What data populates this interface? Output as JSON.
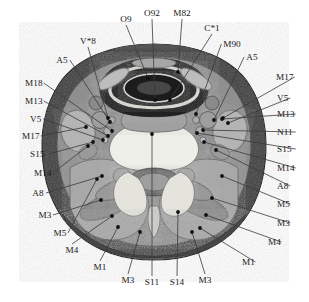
{
  "figure": {
    "type": "labeled-anatomical-cross-section",
    "background_color": "#ffffff",
    "outline_color": "#2b2b2b",
    "palette": {
      "skin_subcutaneous": "#3b3b3b",
      "muscle_mid_gray": "#8e8e8e",
      "muscle_light_gray": "#b9b9b9",
      "bone_marrow_bright": "#eeeeea",
      "air_lumen_dark": "#262626",
      "vessel_gray": "#9c9c9c",
      "cartilage_light": "#d6d6d2",
      "label_text": "#1a1a1a",
      "leader_line": "#3a3a3a"
    },
    "labels": [
      {
        "id": "L01",
        "code": "O9",
        "tx": 126,
        "ty": 22,
        "anchor": "middle",
        "px": 148,
        "py": 78,
        "side": "top"
      },
      {
        "id": "L02",
        "code": "O92",
        "tx": 152,
        "ty": 16,
        "anchor": "middle",
        "px": 155,
        "py": 100,
        "side": "top"
      },
      {
        "id": "L03",
        "code": "M82",
        "tx": 182,
        "ty": 16,
        "anchor": "middle",
        "px": 178,
        "py": 72,
        "side": "top"
      },
      {
        "id": "L04",
        "code": "C*1",
        "tx": 212,
        "ty": 31,
        "anchor": "middle",
        "px": 170,
        "py": 100,
        "side": "top"
      },
      {
        "id": "L05",
        "code": "M90",
        "tx": 232,
        "ty": 47,
        "anchor": "middle",
        "px": 196,
        "py": 114,
        "side": "right"
      },
      {
        "id": "L06",
        "code": "A5",
        "tx": 252,
        "ty": 60,
        "anchor": "middle",
        "px": 214,
        "py": 120,
        "side": "right"
      },
      {
        "id": "L07",
        "code": "M17",
        "tx": 276,
        "ty": 80,
        "anchor": "start",
        "px": 223,
        "py": 118,
        "side": "right"
      },
      {
        "id": "L08",
        "code": "V5",
        "tx": 277,
        "ty": 101,
        "anchor": "start",
        "px": 228,
        "py": 123,
        "side": "right"
      },
      {
        "id": "L09",
        "code": "M13",
        "tx": 277,
        "ty": 117,
        "anchor": "start",
        "px": 222,
        "py": 119,
        "side": "right"
      },
      {
        "id": "L10",
        "code": "N11",
        "tx": 277,
        "ty": 135,
        "anchor": "start",
        "px": 203,
        "py": 130,
        "side": "right"
      },
      {
        "id": "L11",
        "code": "S15",
        "tx": 277,
        "ty": 152,
        "anchor": "start",
        "px": 197,
        "py": 133,
        "side": "right"
      },
      {
        "id": "L12",
        "code": "M14",
        "tx": 277,
        "ty": 171,
        "anchor": "start",
        "px": 204,
        "py": 142,
        "side": "right"
      },
      {
        "id": "L13",
        "code": "A8",
        "tx": 277,
        "ty": 189,
        "anchor": "start",
        "px": 216,
        "py": 150,
        "side": "right"
      },
      {
        "id": "L14",
        "code": "M5",
        "tx": 277,
        "ty": 207,
        "anchor": "start",
        "px": 222,
        "py": 176,
        "side": "right"
      },
      {
        "id": "L15",
        "code": "M3",
        "tx": 277,
        "ty": 226,
        "anchor": "start",
        "px": 212,
        "py": 198,
        "side": "right"
      },
      {
        "id": "L16",
        "code": "M4",
        "tx": 268,
        "ty": 245,
        "anchor": "start",
        "px": 206,
        "py": 215,
        "side": "right"
      },
      {
        "id": "L17",
        "code": "M1",
        "tx": 242,
        "ty": 265,
        "anchor": "start",
        "px": 200,
        "py": 228,
        "side": "bottom"
      },
      {
        "id": "L18",
        "code": "M3",
        "tx": 205,
        "ty": 283,
        "anchor": "middle",
        "px": 192,
        "py": 232,
        "side": "bottom"
      },
      {
        "id": "L19",
        "code": "S14",
        "tx": 177,
        "ty": 285,
        "anchor": "middle",
        "px": 178,
        "py": 212,
        "side": "bottom"
      },
      {
        "id": "L20",
        "code": "S11",
        "tx": 152,
        "ty": 285,
        "anchor": "middle",
        "px": 152,
        "py": 134,
        "side": "bottom"
      },
      {
        "id": "L21",
        "code": "M3",
        "tx": 128,
        "ty": 283,
        "anchor": "middle",
        "px": 140,
        "py": 232,
        "side": "bottom"
      },
      {
        "id": "L22",
        "code": "M1",
        "tx": 100,
        "ty": 270,
        "anchor": "middle",
        "px": 118,
        "py": 227,
        "side": "bottom"
      },
      {
        "id": "L23",
        "code": "M4",
        "tx": 72,
        "ty": 253,
        "anchor": "middle",
        "px": 112,
        "py": 216,
        "side": "bottom"
      },
      {
        "id": "L24",
        "code": "M5",
        "tx": 60,
        "ty": 236,
        "anchor": "middle",
        "px": 97,
        "py": 179,
        "side": "left"
      },
      {
        "id": "L25",
        "code": "M3",
        "tx": 45,
        "ty": 218,
        "anchor": "middle",
        "px": 101,
        "py": 200,
        "side": "left"
      },
      {
        "id": "L26",
        "code": "A8",
        "tx": 38,
        "ty": 196,
        "anchor": "middle",
        "px": 102,
        "py": 176,
        "side": "left"
      },
      {
        "id": "L27",
        "code": "M14",
        "tx": 34,
        "ty": 176,
        "anchor": "start",
        "px": 88,
        "py": 146,
        "side": "left"
      },
      {
        "id": "L28",
        "code": "S15",
        "tx": 30,
        "ty": 157,
        "anchor": "start",
        "px": 93,
        "py": 142,
        "side": "left"
      },
      {
        "id": "L29",
        "code": "M17",
        "tx": 22,
        "ty": 139,
        "anchor": "start",
        "px": 86,
        "py": 127,
        "side": "left"
      },
      {
        "id": "L30",
        "code": "V5",
        "tx": 30,
        "ty": 122,
        "anchor": "start",
        "px": 103,
        "py": 140,
        "side": "left"
      },
      {
        "id": "L31",
        "code": "M13",
        "tx": 25,
        "ty": 104,
        "anchor": "start",
        "px": 108,
        "py": 136,
        "side": "left"
      },
      {
        "id": "L32",
        "code": "M18",
        "tx": 25,
        "ty": 86,
        "anchor": "start",
        "px": 112,
        "py": 131,
        "side": "left"
      },
      {
        "id": "L33",
        "code": "A5",
        "tx": 62,
        "ty": 63,
        "anchor": "middle",
        "px": 110,
        "py": 122,
        "side": "left"
      },
      {
        "id": "L34",
        "code": "V*8",
        "tx": 88,
        "ty": 44,
        "anchor": "middle",
        "px": 108,
        "py": 118,
        "side": "top"
      }
    ]
  }
}
